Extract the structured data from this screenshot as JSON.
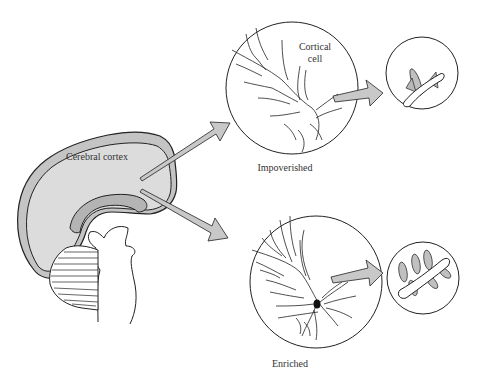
{
  "diagram": {
    "labels": {
      "cerebral_cortex": "Cerebral cortex",
      "cortical_cell_line1": "Cortical",
      "cortical_cell_line2": "cell",
      "impoverished": "Impoverished",
      "enriched": "Enriched"
    },
    "colors": {
      "fill_gray": "#c8c8c8",
      "cortex_fill": "#d4d4d4",
      "stroke": "#222222",
      "background": "#ffffff"
    },
    "panels": [
      {
        "name": "impoverished-neuron",
        "label": "Impoverished",
        "detail": "few dendritic spines"
      },
      {
        "name": "enriched-neuron",
        "label": "Enriched",
        "detail": "many dendritic spines"
      }
    ]
  }
}
